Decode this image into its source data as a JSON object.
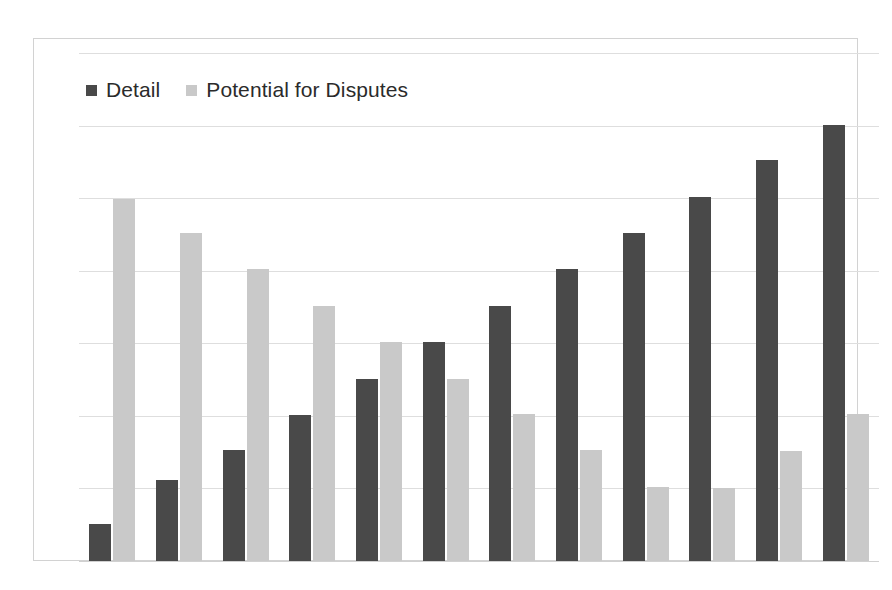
{
  "legend": {
    "position": "top-left-inside",
    "entries": [
      {
        "label": "Detail",
        "color": "#494949",
        "swatch": "square-swatch"
      },
      {
        "label": "Potential for Disputes",
        "color": "#c9c9c9",
        "swatch": "square-swatch"
      }
    ]
  },
  "chart_data": {
    "type": "bar",
    "title": "",
    "subtitle": "",
    "xlabel": "",
    "ylabel": "",
    "grid": true,
    "gridlines": 8,
    "ylim": [
      0,
      7
    ],
    "yticks": [
      0,
      1,
      2,
      3,
      4,
      5,
      6,
      7
    ],
    "ytick_labels": [
      "",
      "",
      "",
      "",
      "",
      "",
      "",
      ""
    ],
    "xtick_labels": [
      "",
      "",
      "",
      "",
      "",
      "",
      "",
      "",
      "",
      "",
      "",
      ""
    ],
    "categories": [
      "1",
      "2",
      "3",
      "4",
      "5",
      "6",
      "7",
      "8",
      "9",
      "10",
      "11",
      "12"
    ],
    "legend_position": "upper left",
    "series": [
      {
        "name": "Detail",
        "color": "#494949",
        "values": [
          0.51,
          1.11,
          1.53,
          2.01,
          2.51,
          3.02,
          3.52,
          4.02,
          4.52,
          5.01,
          5.52,
          6.01
        ]
      },
      {
        "name": "Potential for Disputes",
        "color": "#c9c9c9",
        "values": [
          4.99,
          4.52,
          4.02,
          3.52,
          3.02,
          2.51,
          2.02,
          1.53,
          1.02,
          1.01,
          1.52,
          2.03
        ]
      }
    ]
  },
  "style": {
    "background": "#ffffff",
    "frame_color": "#d2d2d2",
    "grid_color": "#dedede",
    "baseline_color": "#d0d0d0"
  }
}
